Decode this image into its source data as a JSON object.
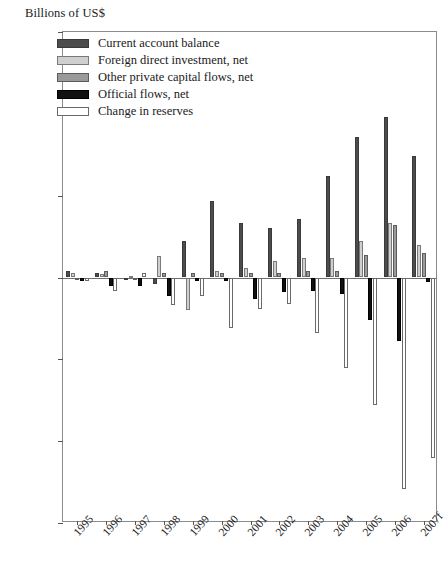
{
  "chart_data": {
    "type": "bar",
    "title": "Billions of US$",
    "xlabel": "",
    "ylabel": "Billions of US$",
    "ylim": [
      -150,
      150
    ],
    "yticks": [
      150,
      100,
      50,
      0,
      -50,
      -100,
      -150
    ],
    "ytick_labels": [
      "150",
      "100",
      "50",
      "0",
      "−50",
      "−100",
      "−150"
    ],
    "grid": false,
    "legend_position": "top-left",
    "categories": [
      "1995",
      "1996",
      "1997",
      "1998",
      "1999",
      "2000",
      "2001",
      "2002",
      "2003",
      "2004",
      "2005",
      "2006",
      "2007f"
    ],
    "series": [
      {
        "name": "Current account balance",
        "color": "#4c4c4c",
        "values": [
          4,
          3,
          -1,
          -4,
          22,
          47,
          33,
          30,
          36,
          62,
          86,
          98,
          74
        ]
      },
      {
        "name": "Foreign direct investment, net",
        "color": "#cfcfcf",
        "values": [
          3,
          2,
          1,
          13,
          -20,
          4,
          6,
          10,
          12,
          12,
          22,
          33,
          20
        ]
      },
      {
        "name": "Other private capital flows, net",
        "color": "#9a9a9a",
        "values": [
          0,
          4,
          0,
          3,
          3,
          3,
          3,
          3,
          4,
          4,
          14,
          32,
          15
        ]
      },
      {
        "name": "Official flows, net",
        "color": "#111111",
        "values": [
          -2,
          -5,
          -5,
          -11,
          -2,
          -2,
          -13,
          -9,
          -8,
          -10,
          -26,
          -39,
          -3
        ]
      },
      {
        "name": "Change in reserves",
        "color": "#ffffff",
        "values": [
          -2,
          -8,
          3,
          -17,
          -11,
          -31,
          -19,
          -16,
          -34,
          -55,
          -78,
          -129,
          -110
        ]
      }
    ]
  },
  "legend": {
    "items": [
      {
        "label": "Current account balance"
      },
      {
        "label": "Foreign direct investment, net"
      },
      {
        "label": "Other private capital flows, net"
      },
      {
        "label": "Official flows, net"
      },
      {
        "label": "Change in reserves"
      }
    ]
  }
}
